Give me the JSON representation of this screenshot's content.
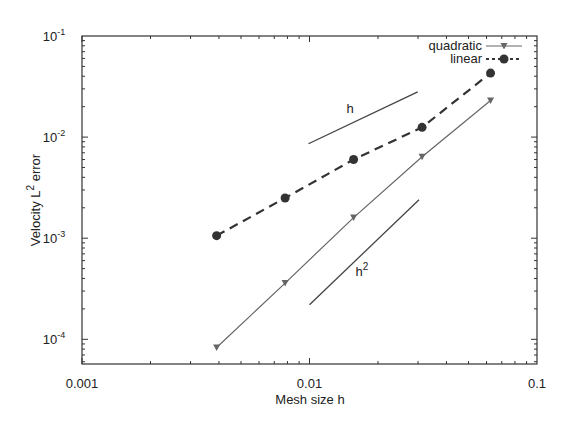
{
  "chart_data": {
    "type": "line",
    "title": "",
    "xlabel": "Mesh size h",
    "ylabel": "Velocity L² error",
    "xscale": "log",
    "yscale": "log",
    "xlim": [
      0.001,
      0.1
    ],
    "ylim": [
      5.7e-05,
      0.1
    ],
    "xticks": [
      {
        "value": 0.001,
        "label": "0.001"
      },
      {
        "value": 0.01,
        "label": "0.01"
      },
      {
        "value": 0.1,
        "label": "0.1"
      }
    ],
    "yticks": [
      {
        "value": 0.1,
        "base": "10",
        "exp": "-1"
      },
      {
        "value": 0.01,
        "base": "10",
        "exp": "-2"
      },
      {
        "value": 0.001,
        "base": "10",
        "exp": "-3"
      },
      {
        "value": 0.0001,
        "base": "10",
        "exp": "-4"
      }
    ],
    "grid": false,
    "legend_position": "upper right",
    "series": [
      {
        "name": "quadratic",
        "style": "solid",
        "marker": "triangle-down",
        "color": "#666666",
        "x": [
          0.00390625,
          0.0078125,
          0.015625,
          0.03125,
          0.0625
        ],
        "y": [
          8.3e-05,
          0.00036,
          0.0016,
          0.0064,
          0.023
        ]
      },
      {
        "name": "linear",
        "style": "dashed",
        "marker": "circle",
        "color": "#333333",
        "x": [
          0.00390625,
          0.0078125,
          0.015625,
          0.03125,
          0.0625
        ],
        "y": [
          0.00106,
          0.0025,
          0.006,
          0.0125,
          0.043
        ]
      }
    ],
    "annotations": [
      {
        "label": "h",
        "type": "slope-reference",
        "x": [
          0.0099,
          0.0299
        ],
        "y": [
          0.0086,
          0.028
        ],
        "text_pos": [
          0.0145,
          0.017
        ]
      },
      {
        "label": "h²",
        "type": "slope-reference",
        "x": [
          0.01,
          0.0303
        ],
        "y": [
          0.00022,
          0.0024
        ],
        "text_pos": [
          0.0166,
          0.00045
        ]
      }
    ]
  },
  "labels": {
    "xlabel": "Mesh size h",
    "ylabel_prefix": "Velocity L",
    "ylabel_sup": "2",
    "ylabel_suffix": " error",
    "legend_quadratic": "quadratic",
    "legend_linear": "linear",
    "annot_h": "h",
    "annot_h2_base": "h",
    "annot_h2_sup": "2"
  }
}
